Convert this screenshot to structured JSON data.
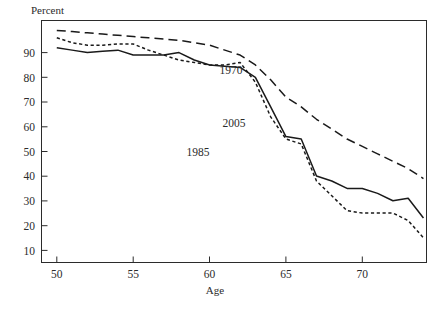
{
  "chart_data": {
    "type": "line",
    "title": "",
    "xlabel": "Age",
    "ylabel": "Percent",
    "xlim": [
      49.0,
      74.2
    ],
    "ylim": [
      0,
      98
    ],
    "grid": false,
    "legend": "inline-annotations",
    "xticks": [
      50,
      55,
      60,
      65,
      70
    ],
    "xtick_labels": [
      "50",
      "55",
      "60",
      "65",
      "70"
    ],
    "yticks": [
      10,
      20,
      30,
      40,
      50,
      60,
      70,
      80,
      90
    ],
    "ytick_labels": [
      "10",
      "20",
      "30",
      "40",
      "50",
      "60",
      "70",
      "80",
      "90"
    ],
    "x": [
      50,
      51,
      52,
      53,
      54,
      55,
      56,
      57,
      58,
      59,
      60,
      61,
      62,
      63,
      64,
      65,
      66,
      67,
      68,
      69,
      70,
      71,
      72,
      73,
      74
    ],
    "series": [
      {
        "name": "1970",
        "style": "long-dash",
        "label_text": "1970",
        "values": [
          94,
          93.5,
          93,
          92.5,
          92,
          91.5,
          91,
          90.5,
          90,
          89,
          88,
          86,
          84,
          80,
          74,
          67,
          63,
          58,
          54,
          50,
          47,
          44,
          41,
          38,
          34
        ]
      },
      {
        "name": "2005",
        "style": "solid",
        "label_text": "2005",
        "values": [
          87,
          86,
          85,
          85.5,
          86,
          84,
          84,
          84,
          85,
          82,
          80,
          79.5,
          79,
          75,
          63,
          51,
          50,
          35,
          33,
          30,
          30,
          28,
          25,
          26,
          18
        ]
      },
      {
        "name": "1985",
        "style": "short-dash",
        "label_text": "1985",
        "values": [
          91,
          89,
          88,
          88,
          88.5,
          88.5,
          86,
          84,
          82,
          81,
          80,
          80,
          81,
          73,
          59,
          50,
          48,
          33,
          27,
          21,
          20,
          20,
          20,
          17,
          10
        ]
      }
    ],
    "annotations": [
      {
        "text": "1970",
        "x_px": 231,
        "y_px": 74
      },
      {
        "text": "2005",
        "x_px": 234,
        "y_px": 127
      },
      {
        "text": "1985",
        "x_px": 198,
        "y_px": 156
      }
    ]
  },
  "axes": {
    "y_axis_title": "Percent",
    "x_axis_title": "Age"
  }
}
